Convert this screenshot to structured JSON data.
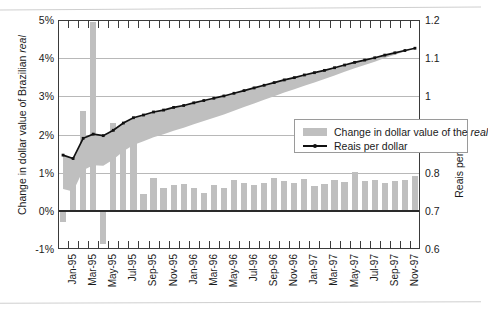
{
  "chart_data": {
    "type": "bar",
    "title": "",
    "subtitle": "",
    "xlabel": "",
    "ylabel": "Change in dollar value of Brazilian real",
    "ylabel_right": "Reais per dollar",
    "ylim": [
      -1,
      5
    ],
    "ylim_right": [
      0.6,
      1.2
    ],
    "grid": true,
    "legend_position": "inside-center-right",
    "x": [
      "Jan-95",
      "Feb-95",
      "Mar-95",
      "Apr-95",
      "May-95",
      "Jun-95",
      "Jul-95",
      "Aug-95",
      "Sep-95",
      "Oct-95",
      "Nov-95",
      "Dec-95",
      "Jan-96",
      "Feb-96",
      "Mar-96",
      "Apr-96",
      "May-96",
      "Jun-96",
      "Jul-96",
      "Aug-96",
      "Sep-96",
      "Oct-96",
      "Nov-96",
      "Dec-96",
      "Jan-97",
      "Feb-97",
      "Mar-97",
      "Apr-97",
      "May-97",
      "Jun-97",
      "Jul-97",
      "Aug-97",
      "Sep-97",
      "Oct-97",
      "Nov-97",
      "Dec-97"
    ],
    "xtick_labels": [
      "Jan-95",
      "Mar-95",
      "May-95",
      "Jul-95",
      "Sep-95",
      "Nov-95",
      "Jan-96",
      "Mar-96",
      "May-96",
      "Jul-96",
      "Sep-96",
      "Nov-96",
      "Jan-97",
      "Mar-97",
      "May-97",
      "Jul-97",
      "Sep-97",
      "Nov-97"
    ],
    "ytick_labels_left": [
      "5%",
      "4%",
      "3%",
      "2%",
      "1%",
      "0%",
      "-1%"
    ],
    "ytick_values_left": [
      5,
      4,
      3,
      2,
      1,
      0,
      -1
    ],
    "ytick_labels_right": [
      "1.2",
      "1.1",
      "1",
      "0.9",
      "0.8",
      "0.7",
      "0.6"
    ],
    "ytick_values_right": [
      1.2,
      1.1,
      1.0,
      0.9,
      0.8,
      0.7,
      0.6
    ],
    "series": [
      {
        "name": "Change in dollar value of the real",
        "type": "bar",
        "axis": "left",
        "unit": "%",
        "color": "#bfbfbf",
        "values": [
          -0.3,
          1.13,
          2.62,
          4.94,
          -0.86,
          2.3,
          1.73,
          1.9,
          0.43,
          0.87,
          0.6,
          0.69,
          0.7,
          0.6,
          0.47,
          0.69,
          0.61,
          0.81,
          0.73,
          0.67,
          0.74,
          0.87,
          0.78,
          0.73,
          0.84,
          0.66,
          0.7,
          0.82,
          0.76,
          1.01,
          0.78,
          0.82,
          0.74,
          0.79,
          0.81,
          0.9
        ]
      },
      {
        "name": "Reais per dollar",
        "type": "line",
        "axis": "right",
        "unit": "reais",
        "color": "#111111",
        "values": [
          0.846,
          0.837,
          0.89,
          0.901,
          0.897,
          0.911,
          0.93,
          0.944,
          0.951,
          0.959,
          0.964,
          0.971,
          0.976,
          0.983,
          0.989,
          0.995,
          1.001,
          1.008,
          1.015,
          1.022,
          1.029,
          1.036,
          1.043,
          1.049,
          1.056,
          1.062,
          1.068,
          1.075,
          1.082,
          1.089,
          1.095,
          1.101,
          1.108,
          1.114,
          1.12,
          1.126
        ]
      }
    ],
    "band_note": "Shaded band between the reais-per-dollar line and the cumulative change baseline"
  },
  "legend": {
    "items": [
      {
        "label_pre": "Change in dollar value of the ",
        "label_italic": "real",
        "swatch": "bar",
        "color": "#bfbfbf"
      },
      {
        "label_pre": "Reais per dollar",
        "label_italic": "",
        "swatch": "line",
        "color": "#111111"
      }
    ]
  },
  "axis_titles": {
    "left_pre": "Change in dollar value of Brazilian ",
    "left_italic": "real",
    "right": "Reais per dollar"
  }
}
